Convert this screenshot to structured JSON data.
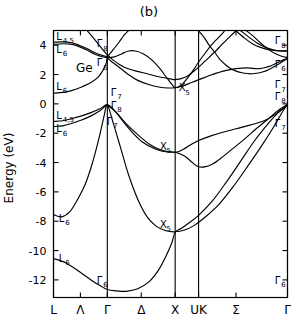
{
  "figure": {
    "panel_title": "(b)",
    "material": "Ge",
    "y_axis_title": "Energy (eV)"
  },
  "chart_data": {
    "type": "line",
    "title": "(b)",
    "subtitle": "Ge",
    "xlabel": "",
    "ylabel": "Energy (eV)",
    "ylim": [
      -13.2,
      5.0
    ],
    "yticks": [
      4,
      2,
      0,
      -2,
      -4,
      -6,
      -8,
      -10,
      -12
    ],
    "ytick_labels": [
      "4",
      "2",
      "0",
      "-2",
      "-4",
      "-6",
      "-8",
      "-10",
      "-12"
    ],
    "grid": false,
    "legend": "none",
    "x_symmetry_points": [
      {
        "label": "L",
        "x": 0.0
      },
      {
        "label": "Λ",
        "x": 0.115
      },
      {
        "label": "Γ",
        "x": 0.23
      },
      {
        "label": "Δ",
        "x": 0.375
      },
      {
        "label": "X",
        "x": 0.52
      },
      {
        "label": "UK",
        "x": 0.62
      },
      {
        "label": "Σ",
        "x": 0.78
      },
      {
        "label": "Γ",
        "x": 1.0
      }
    ],
    "vertical_lines_x": [
      0.0,
      0.23,
      0.52,
      0.62,
      1.0
    ],
    "xtick_labels": [
      "L",
      "Λ",
      "Γ",
      "Δ",
      "X",
      "UK",
      "Σ",
      "Γ"
    ],
    "band_labels": [
      {
        "text": "L",
        "sub": "4,5",
        "x": 0.012,
        "y": 4.35
      },
      {
        "text": "L",
        "sub": "6",
        "x": 0.012,
        "y": 3.45
      },
      {
        "text": "L",
        "sub": "6",
        "x": 0.012,
        "y": 0.95
      },
      {
        "text": "L",
        "sub": "4,5",
        "x": 0.012,
        "y": -1.05
      },
      {
        "text": "L",
        "sub": "6",
        "x": 0.012,
        "y": -1.95
      },
      {
        "text": "L",
        "sub": "6",
        "x": 0.022,
        "y": -8.05
      },
      {
        "text": "L",
        "sub": "6",
        "x": 0.022,
        "y": -10.75
      },
      {
        "text": "Γ",
        "sub": "8",
        "x": 0.185,
        "y": 3.85
      },
      {
        "text": "Γ",
        "sub": "6",
        "x": 0.185,
        "y": 2.55
      },
      {
        "text": "Γ",
        "sub": "7",
        "x": 0.245,
        "y": 0.55
      },
      {
        "text": "Γ",
        "sub": "8",
        "x": 0.245,
        "y": -0.35
      },
      {
        "text": "Γ",
        "sub": "7",
        "x": 0.228,
        "y": -1.45
      },
      {
        "text": "Γ",
        "sub": "6",
        "x": 0.185,
        "y": -12.25
      },
      {
        "text": "X",
        "sub": "5",
        "x": 0.535,
        "y": 0.85
      },
      {
        "text": "X",
        "sub": "5",
        "x": 0.455,
        "y": -3.15
      },
      {
        "text": "X",
        "sub": "5",
        "x": 0.455,
        "y": -8.45
      },
      {
        "text": "Γ",
        "sub": "8",
        "x": 0.945,
        "y": 4.05
      },
      {
        "text": "Γ",
        "sub": "6",
        "x": 0.945,
        "y": 2.45
      },
      {
        "text": "Γ",
        "sub": "7",
        "x": 0.945,
        "y": 1.05
      },
      {
        "text": "Γ",
        "sub": "8",
        "x": 0.945,
        "y": 0.25
      },
      {
        "text": "Γ",
        "sub": "7",
        "x": 0.945,
        "y": -1.55
      },
      {
        "text": "Γ",
        "sub": "6",
        "x": 0.945,
        "y": -12.25
      }
    ],
    "series": [
      {
        "name": "valence-band-1-lowest",
        "points": [
          [
            0.0,
            -10.55
          ],
          [
            0.04,
            -10.75
          ],
          [
            0.08,
            -11.1
          ],
          [
            0.12,
            -11.55
          ],
          [
            0.16,
            -12.0
          ],
          [
            0.2,
            -12.4
          ],
          [
            0.23,
            -12.65
          ],
          [
            0.27,
            -12.75
          ],
          [
            0.31,
            -12.78
          ],
          [
            0.36,
            -12.6
          ],
          [
            0.41,
            -12.1
          ],
          [
            0.45,
            -11.3
          ],
          [
            0.48,
            -10.4
          ],
          [
            0.505,
            -9.5
          ],
          [
            0.52,
            -8.75
          ],
          [
            0.545,
            -8.5
          ],
          [
            0.58,
            -8.1
          ],
          [
            0.62,
            -7.6
          ],
          [
            0.68,
            -6.6
          ],
          [
            0.74,
            -5.3
          ],
          [
            0.8,
            -3.9
          ],
          [
            0.86,
            -2.5
          ],
          [
            0.92,
            -1.3
          ],
          [
            0.96,
            -0.6
          ],
          [
            1.0,
            -0.05
          ]
        ]
      },
      {
        "name": "valence-band-2",
        "points": [
          [
            0.0,
            -7.55
          ],
          [
            0.035,
            -7.7
          ],
          [
            0.07,
            -7.35
          ],
          [
            0.1,
            -6.6
          ],
          [
            0.135,
            -5.5
          ],
          [
            0.165,
            -4.1
          ],
          [
            0.195,
            -2.3
          ],
          [
            0.215,
            -0.9
          ],
          [
            0.23,
            -0.1
          ],
          [
            0.255,
            -1.3
          ],
          [
            0.285,
            -2.9
          ],
          [
            0.32,
            -4.8
          ],
          [
            0.36,
            -6.5
          ],
          [
            0.4,
            -7.7
          ],
          [
            0.44,
            -8.35
          ],
          [
            0.48,
            -8.65
          ],
          [
            0.52,
            -8.72
          ],
          [
            0.56,
            -8.6
          ],
          [
            0.6,
            -8.3
          ],
          [
            0.65,
            -7.7
          ],
          [
            0.71,
            -6.8
          ],
          [
            0.77,
            -5.6
          ],
          [
            0.83,
            -4.25
          ],
          [
            0.89,
            -2.85
          ],
          [
            0.94,
            -1.6
          ],
          [
            0.98,
            -0.5
          ],
          [
            1.0,
            -0.05
          ]
        ]
      },
      {
        "name": "valence-band-3-heavy-hole",
        "points": [
          [
            0.0,
            -1.2
          ],
          [
            0.04,
            -1.15
          ],
          [
            0.08,
            -1.0
          ],
          [
            0.12,
            -0.82
          ],
          [
            0.16,
            -0.6
          ],
          [
            0.2,
            -0.32
          ],
          [
            0.23,
            -0.05
          ],
          [
            0.26,
            -0.45
          ],
          [
            0.3,
            -1.25
          ],
          [
            0.34,
            -2.0
          ],
          [
            0.38,
            -2.6
          ],
          [
            0.43,
            -3.05
          ],
          [
            0.47,
            -3.25
          ],
          [
            0.52,
            -3.3
          ],
          [
            0.56,
            -3.55
          ],
          [
            0.59,
            -3.95
          ],
          [
            0.615,
            -4.25
          ],
          [
            0.645,
            -4.3
          ],
          [
            0.68,
            -4.1
          ],
          [
            0.72,
            -3.65
          ],
          [
            0.77,
            -3.0
          ],
          [
            0.82,
            -2.35
          ],
          [
            0.87,
            -1.65
          ],
          [
            0.92,
            -1.0
          ],
          [
            0.96,
            -0.45
          ],
          [
            1.0,
            -0.05
          ]
        ]
      },
      {
        "name": "valence-band-4-light-hole",
        "points": [
          [
            0.0,
            -1.55
          ],
          [
            0.04,
            -1.5
          ],
          [
            0.08,
            -1.32
          ],
          [
            0.12,
            -1.1
          ],
          [
            0.16,
            -0.82
          ],
          [
            0.2,
            -0.45
          ],
          [
            0.23,
            -0.12
          ],
          [
            0.27,
            -0.62
          ],
          [
            0.31,
            -1.35
          ],
          [
            0.36,
            -2.1
          ],
          [
            0.41,
            -2.75
          ],
          [
            0.46,
            -3.15
          ],
          [
            0.52,
            -3.3
          ],
          [
            0.555,
            -3.1
          ],
          [
            0.59,
            -2.75
          ],
          [
            0.62,
            -2.5
          ],
          [
            0.67,
            -2.2
          ],
          [
            0.72,
            -1.95
          ],
          [
            0.78,
            -1.7
          ],
          [
            0.84,
            -1.45
          ],
          [
            0.9,
            -1.15
          ],
          [
            0.95,
            -0.7
          ],
          [
            1.0,
            -0.1
          ]
        ]
      },
      {
        "name": "conduction-band-1",
        "points": [
          [
            0.0,
            0.72
          ],
          [
            0.04,
            0.78
          ],
          [
            0.08,
            0.92
          ],
          [
            0.12,
            1.15
          ],
          [
            0.16,
            1.45
          ],
          [
            0.19,
            1.8
          ],
          [
            0.21,
            2.25
          ],
          [
            0.225,
            2.75
          ],
          [
            0.23,
            3.1
          ],
          [
            0.25,
            2.85
          ],
          [
            0.28,
            2.5
          ],
          [
            0.32,
            2.0
          ],
          [
            0.36,
            1.6
          ],
          [
            0.41,
            1.3
          ],
          [
            0.45,
            1.15
          ],
          [
            0.49,
            1.08
          ],
          [
            0.52,
            1.1
          ],
          [
            0.55,
            1.2
          ],
          [
            0.59,
            1.45
          ],
          [
            0.63,
            1.7
          ],
          [
            0.68,
            2.0
          ],
          [
            0.73,
            2.25
          ],
          [
            0.78,
            2.4
          ],
          [
            0.83,
            2.45
          ],
          [
            0.88,
            2.4
          ],
          [
            0.93,
            2.6
          ],
          [
            0.97,
            2.9
          ],
          [
            1.0,
            3.1
          ]
        ]
      },
      {
        "name": "conduction-band-2",
        "points": [
          [
            0.0,
            4.05
          ],
          [
            0.04,
            4.1
          ],
          [
            0.08,
            4.05
          ],
          [
            0.11,
            3.9
          ],
          [
            0.145,
            3.65
          ],
          [
            0.175,
            3.4
          ],
          [
            0.2,
            3.25
          ],
          [
            0.23,
            3.15
          ],
          [
            0.26,
            3.2
          ],
          [
            0.29,
            3.4
          ],
          [
            0.32,
            3.6
          ],
          [
            0.35,
            3.6
          ],
          [
            0.385,
            3.4
          ],
          [
            0.42,
            3.0
          ],
          [
            0.455,
            2.4
          ],
          [
            0.485,
            1.75
          ],
          [
            0.51,
            1.25
          ],
          [
            0.52,
            1.1
          ],
          [
            0.545,
            1.25
          ],
          [
            0.57,
            1.7
          ],
          [
            0.6,
            2.35
          ],
          [
            0.62,
            2.85
          ],
          [
            0.65,
            3.5
          ],
          [
            0.68,
            4.1
          ],
          [
            0.71,
            4.6
          ],
          [
            0.73,
            4.95
          ]
        ]
      },
      {
        "name": "conduction-band-3",
        "points": [
          [
            0.0,
            4.2
          ],
          [
            0.04,
            4.22
          ],
          [
            0.08,
            4.15
          ],
          [
            0.11,
            4.0
          ],
          [
            0.145,
            3.75
          ],
          [
            0.175,
            3.5
          ],
          [
            0.2,
            3.35
          ],
          [
            0.23,
            3.25
          ],
          [
            0.255,
            3.7
          ],
          [
            0.28,
            4.2
          ],
          [
            0.3,
            4.65
          ],
          [
            0.32,
            4.98
          ]
        ]
      },
      {
        "name": "conduction-band-4-left-upper",
        "points": [
          [
            0.145,
            4.98
          ],
          [
            0.165,
            4.6
          ],
          [
            0.19,
            4.1
          ],
          [
            0.21,
            3.7
          ],
          [
            0.23,
            3.35
          ],
          [
            0.25,
            3.05
          ],
          [
            0.28,
            2.7
          ],
          [
            0.31,
            2.45
          ],
          [
            0.35,
            2.25
          ],
          [
            0.4,
            2.05
          ],
          [
            0.45,
            1.85
          ],
          [
            0.5,
            1.7
          ],
          [
            0.52,
            1.65
          ],
          [
            0.56,
            1.8
          ],
          [
            0.59,
            2.1
          ],
          [
            0.62,
            2.5
          ],
          [
            0.65,
            2.95
          ],
          [
            0.69,
            3.55
          ],
          [
            0.72,
            4.05
          ],
          [
            0.755,
            4.6
          ],
          [
            0.78,
            4.98
          ]
        ]
      },
      {
        "name": "conduction-band-5-right",
        "points": [
          [
            0.825,
            4.98
          ],
          [
            0.855,
            4.6
          ],
          [
            0.885,
            4.15
          ],
          [
            0.915,
            3.75
          ],
          [
            0.945,
            3.45
          ],
          [
            0.975,
            3.25
          ],
          [
            1.0,
            3.15
          ]
        ]
      },
      {
        "name": "conduction-band-6-right-upper",
        "points": [
          [
            0.8,
            4.98
          ],
          [
            0.835,
            4.55
          ],
          [
            0.87,
            4.15
          ],
          [
            0.9,
            3.9
          ],
          [
            0.935,
            3.7
          ],
          [
            0.97,
            3.6
          ],
          [
            1.0,
            3.6
          ]
        ]
      },
      {
        "name": "conduction-band-7-right-outer",
        "points": [
          [
            0.78,
            4.98
          ],
          [
            0.815,
            4.5
          ],
          [
            0.85,
            4.1
          ],
          [
            0.885,
            3.85
          ],
          [
            0.925,
            3.68
          ],
          [
            0.96,
            3.62
          ],
          [
            1.0,
            3.62
          ]
        ]
      },
      {
        "name": "conduction-band-8-gamma-right",
        "points": [
          [
            0.62,
            4.98
          ],
          [
            0.645,
            4.5
          ],
          [
            0.665,
            4.0
          ],
          [
            0.69,
            3.5
          ],
          [
            0.71,
            3.05
          ],
          [
            0.74,
            2.6
          ],
          [
            0.77,
            2.3
          ],
          [
            0.81,
            2.1
          ],
          [
            0.85,
            2.05
          ],
          [
            0.9,
            2.2
          ],
          [
            0.95,
            2.6
          ],
          [
            1.0,
            3.1
          ]
        ]
      }
    ]
  }
}
